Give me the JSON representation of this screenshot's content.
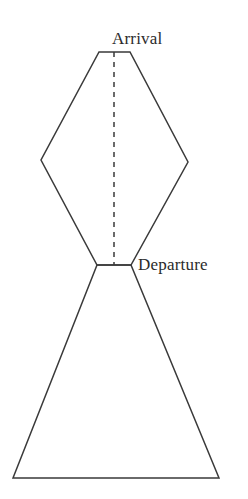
{
  "figure": {
    "background_color": "#ffffff",
    "stroke_color": "#3a3a3a",
    "label_color": "#2b2b2b",
    "stroke_width": 1.5,
    "canvas": {
      "width": 248,
      "height": 499
    }
  },
  "labels": {
    "arrival": "Arrival",
    "departure": "Departure"
  },
  "shapes": {
    "upper_polygon": {
      "name": "rhombus-upper",
      "points": "99,52 130,52 188,162 131,265 97,265 41,160"
    },
    "lower_polygon": {
      "name": "triangle-lower",
      "points": "97,265 131,265 219,478 13,478"
    },
    "axis_line": {
      "name": "dashed-center-axis",
      "x": 114,
      "y_start": 52,
      "y_end": 265,
      "dash_pattern": "5,5"
    }
  }
}
